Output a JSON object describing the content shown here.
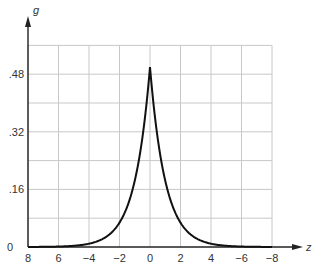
{
  "chart_data": {
    "type": "line",
    "title": "",
    "xlabel": "z",
    "ylabel": "g",
    "xlim": [
      -8,
      8
    ],
    "ylim": [
      0,
      0.56
    ],
    "grid": true,
    "x_tick_labels": [
      "8",
      "6",
      "−4",
      "−2",
      "0",
      "2",
      "4",
      "−6",
      "−8"
    ],
    "y_tick_labels": [
      "0",
      ".16",
      ".32",
      ".48"
    ],
    "y_tick_values": [
      0,
      0.16,
      0.32,
      0.48
    ],
    "series": [
      {
        "name": "g(z)",
        "x": [
          -8,
          -6,
          -4,
          -3,
          -2,
          -1.5,
          -1,
          -0.5,
          0,
          0.5,
          1,
          1.5,
          2,
          3,
          4,
          6,
          8
        ],
        "values": [
          0.0002,
          0.0012,
          0.009,
          0.025,
          0.068,
          0.112,
          0.184,
          0.303,
          0.5,
          0.303,
          0.184,
          0.112,
          0.068,
          0.025,
          0.009,
          0.0012,
          0.0002
        ]
      }
    ],
    "colors": {
      "curve": "#111111",
      "grid": "#c8c8c8",
      "axis": "#222222"
    }
  }
}
